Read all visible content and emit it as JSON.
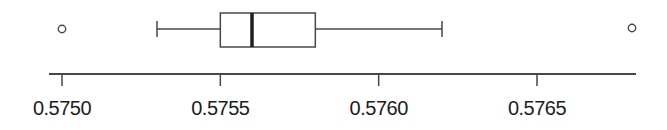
{
  "figure": {
    "width": 667,
    "height": 130
  },
  "chart_data": {
    "type": "boxplot",
    "orientation": "horizontal",
    "title": "",
    "xlabel": "",
    "ylabel": "",
    "grid": false,
    "legend": false,
    "xlim": [
      0.57496,
      0.57681
    ],
    "x_ticks": [
      0.575,
      0.5755,
      0.576,
      0.5765
    ],
    "x_tick_labels": [
      "0.5750",
      "0.5755",
      "0.5760",
      "0.5765"
    ],
    "box": {
      "whisker_low": 0.5753,
      "q1": 0.5755,
      "median": 0.5756,
      "q3": 0.5758,
      "whisker_high": 0.5762,
      "outliers": [
        0.575,
        0.5768
      ]
    }
  },
  "colors": {
    "line": "#474747",
    "text": "#1c1c1c",
    "background": "#ffffff"
  }
}
